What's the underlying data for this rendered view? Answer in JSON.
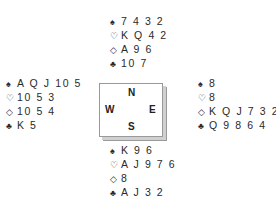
{
  "suits": {
    "spades": "♠",
    "hearts": "♡",
    "diamonds": "◇",
    "clubs": "♣"
  },
  "compass": {
    "north": "N",
    "west": "W",
    "east": "E",
    "south": "S"
  },
  "hands": {
    "north": {
      "spades": "7 4 3 2",
      "hearts": "K Q 4 2",
      "diamonds": "A 9 6",
      "clubs": "10 7"
    },
    "west": {
      "spades": "A Q J 10 5",
      "hearts": "10 5 3",
      "diamonds": "10 5 4",
      "clubs": "K 5"
    },
    "east": {
      "spades": "8",
      "hearts": "8",
      "diamonds": "K Q J 7 3 2",
      "clubs": "Q 9 8 6 4"
    },
    "south": {
      "spades": "K 9 6",
      "hearts": "A J 9 7 6",
      "diamonds": "8",
      "clubs": "A J 3 2"
    }
  }
}
